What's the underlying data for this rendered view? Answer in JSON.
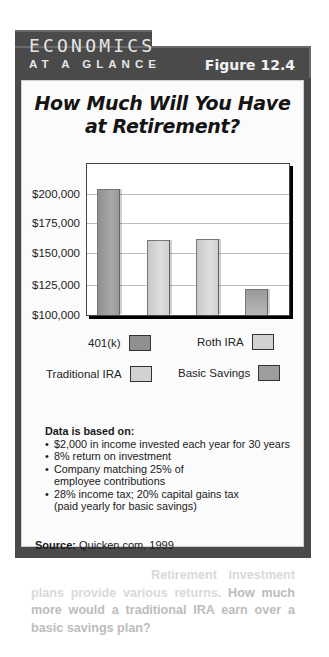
{
  "header": {
    "series_title_line1": "ECONOMICS",
    "series_title_line2": "AT A GLANCE",
    "figure_label": "Figure 12.4"
  },
  "title": {
    "line1": "How Much Will You Have",
    "line2": "at Retirement?"
  },
  "colors": {
    "frame": "#4a4a4a",
    "panel": "#fbfbfb",
    "dark_bar": "#9b9b9b",
    "light_bar": "#d4d4d4"
  },
  "chart_data": {
    "type": "bar",
    "xlabel": "",
    "ylabel": "",
    "categories": [
      "401(k)",
      "Traditional IRA",
      "Roth IRA",
      "Basic Savings"
    ],
    "values": [
      205000,
      162500,
      163000,
      121500
    ],
    "ylim": [
      100000,
      225000
    ],
    "yticks": [
      100000,
      125000,
      150000,
      175000,
      200000
    ],
    "ytick_labels": [
      "$100,000",
      "$125,000",
      "$150,000",
      "$175,000",
      "$200,000"
    ],
    "grid": true,
    "legend": {
      "position": "bottom",
      "entries": [
        "401(k)",
        "Roth IRA",
        "Traditional IRA",
        "Basic Savings"
      ]
    },
    "bar_colors": [
      "#9b9b9b",
      "#d4d4d4",
      "#d4d4d4",
      "#a3a3a3"
    ]
  },
  "legend": {
    "k401": "401(k)",
    "roth": "Roth IRA",
    "traditional": "Traditional IRA",
    "basic": "Basic Savings"
  },
  "notes": {
    "heading": "Data is based on:",
    "items": [
      "$2,000 in income invested each year for 30 years",
      "8% return on investment",
      "Company matching 25% of employee contributions",
      "28% income tax; 20% capital gains tax (paid yearly for basic savings)"
    ]
  },
  "source": {
    "label": "Source:",
    "text": " Quicken.com, 1999"
  },
  "caption": {
    "heading": "Using Graphs",
    "statement": "Retirement investment plans provide various returns.",
    "question": "How much more would a traditional IRA earn over a basic savings plan?"
  }
}
